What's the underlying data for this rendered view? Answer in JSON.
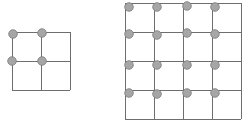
{
  "diagram": {
    "colors": {
      "line": "#6e6e6e",
      "dot_fill": "#a6a6a6",
      "dot_stroke": "#7a7a7a"
    },
    "grids": [
      {
        "name": "grid-2x2",
        "x": 12,
        "y": 32,
        "cell": 29,
        "cols": 2,
        "rows": 2,
        "dots": [
          [
            13,
            34
          ],
          [
            42,
            33
          ],
          [
            12,
            61
          ],
          [
            42,
            61
          ]
        ]
      },
      {
        "name": "grid-4x4",
        "x": 125,
        "y": 3,
        "cell": 29,
        "cols": 4,
        "rows": 4,
        "dots": [
          [
            129,
            7
          ],
          [
            157,
            7
          ],
          [
            187,
            6
          ],
          [
            215,
            7
          ],
          [
            129,
            34
          ],
          [
            157,
            35
          ],
          [
            187,
            33
          ],
          [
            215,
            34
          ],
          [
            129,
            65
          ],
          [
            157,
            65
          ],
          [
            187,
            65
          ],
          [
            215,
            65
          ],
          [
            129,
            93
          ],
          [
            157,
            94
          ],
          [
            187,
            93
          ],
          [
            215,
            93
          ]
        ]
      }
    ]
  }
}
